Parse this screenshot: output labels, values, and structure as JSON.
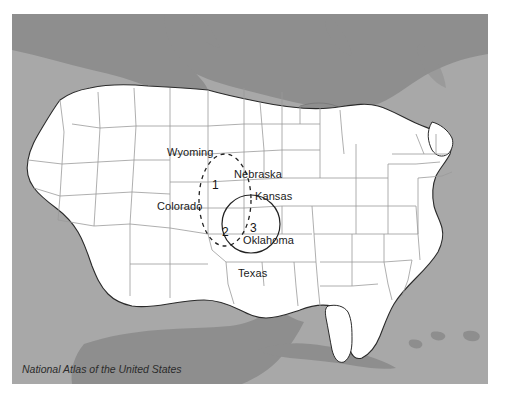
{
  "image": {
    "width": 505,
    "height": 402,
    "background_color": "#ffffff"
  },
  "map": {
    "title": "United States reference map with study regions",
    "frame": {
      "x": 12,
      "y": 14,
      "width": 476,
      "height": 370
    },
    "colors": {
      "ocean": "#a8a8a8",
      "foreign_land": "#8e8e8e",
      "lakes": "#8e8e8e",
      "us_land": "#ffffff",
      "national_border": "#2a2a2a",
      "state_border": "#9a9a9a",
      "label_text": "#1a1a1a",
      "annotation_line": "#222222"
    },
    "state_labels": [
      {
        "name": "wyoming",
        "text": "Wyoming",
        "x": 167,
        "y": 146
      },
      {
        "name": "nebraska",
        "text": "Nebraska",
        "x": 234,
        "y": 168
      },
      {
        "name": "colorado",
        "text": "Colorado",
        "x": 157,
        "y": 200
      },
      {
        "name": "kansas",
        "text": "Kansas",
        "x": 255,
        "y": 190
      },
      {
        "name": "oklahoma",
        "text": "Oklahoma",
        "x": 243,
        "y": 234
      },
      {
        "name": "texas",
        "text": "Texas",
        "x": 238,
        "y": 267
      }
    ],
    "regions": [
      {
        "id": "region-1",
        "label": "1",
        "label_x": 212,
        "label_y": 179,
        "shape": "ellipse-dashed",
        "description": "Upper portion of dashed ellipse spanning eastern Colorado and western Nebraska"
      },
      {
        "id": "region-2",
        "label": "2",
        "label_x": 222,
        "label_y": 226,
        "shape": "ellipse-dashed",
        "description": "Lower portion of dashed ellipse over the Oklahoma panhandle area"
      },
      {
        "id": "region-3",
        "label": "3",
        "label_x": 250,
        "label_y": 222,
        "shape": "circle-solid",
        "description": "Solid circle over southern Kansas and northern Oklahoma"
      }
    ],
    "annotations": {
      "dashed_ellipse": {
        "name": "dashed-study-ellipse",
        "center_x": 225,
        "center_y": 200,
        "radius_x": 26,
        "radius_y": 45,
        "style": "dashed"
      },
      "solid_circle": {
        "name": "solid-study-circle",
        "center_x": 251,
        "center_y": 224,
        "radius": 29,
        "style": "solid"
      }
    },
    "source_caption": "National Atlas of the United States"
  }
}
